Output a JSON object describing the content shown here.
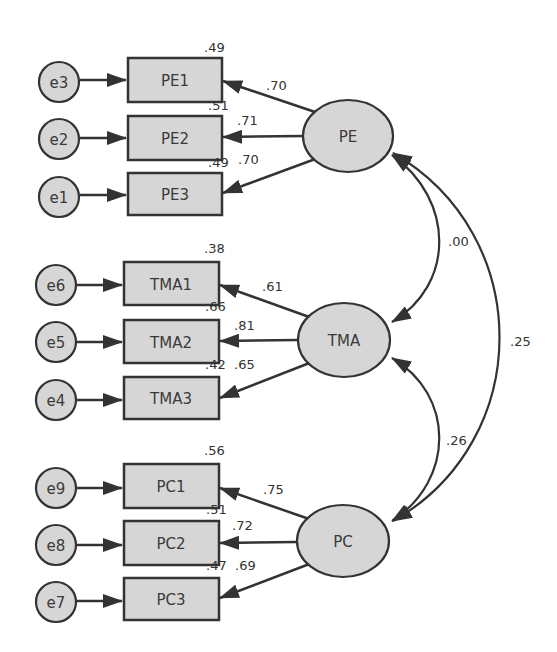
{
  "colors": {
    "node_fill": "#d6d6d6",
    "stroke": "#333333",
    "background": "#ffffff"
  },
  "latent_factors": [
    {
      "id": "PE",
      "label": "PE"
    },
    {
      "id": "TMA",
      "label": "TMA"
    },
    {
      "id": "PC",
      "label": "PC"
    }
  ],
  "indicators": [
    {
      "label": "PE1",
      "error": "e3",
      "loading": ".70",
      "r2": ".49"
    },
    {
      "label": "PE2",
      "error": "e2",
      "loading": ".71",
      "r2": ".51"
    },
    {
      "label": "PE3",
      "error": "e1",
      "loading": ".70",
      "r2": ".49"
    },
    {
      "label": "TMA1",
      "error": "e6",
      "loading": ".61",
      "r2": ".38"
    },
    {
      "label": "TMA2",
      "error": "e5",
      "loading": ".81",
      "r2": ".66"
    },
    {
      "label": "TMA3",
      "error": "e4",
      "loading": ".65",
      "r2": ".42"
    },
    {
      "label": "PC1",
      "error": "e9",
      "loading": ".75",
      "r2": ".56"
    },
    {
      "label": "PC2",
      "error": "e8",
      "loading": ".72",
      "r2": ".51"
    },
    {
      "label": "PC3",
      "error": "e7",
      "loading": ".69",
      "r2": ".47"
    }
  ],
  "covariances": [
    {
      "between": "PE-TMA",
      "value": ".00"
    },
    {
      "between": "TMA-PC",
      "value": ".26"
    },
    {
      "between": "PE-PC",
      "value": ".25"
    }
  ]
}
